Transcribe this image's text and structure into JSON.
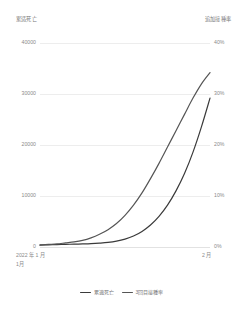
{
  "left_axis_title": "累适死亡",
  "right_axis_title": "追加接種率",
  "x_start_label": "2022 年 1 月",
  "x_start_sublabel": "1月",
  "x_end_label": "2 月",
  "legend": [
    {
      "label": "累適死亡",
      "color": "#3a3a3a",
      "name": "legend-item-deaths"
    },
    {
      "label": "3回目接種率",
      "color": "#555555",
      "name": "legend-item-booster-rate"
    }
  ],
  "chart_data": {
    "type": "line",
    "title": "",
    "xlabel": "",
    "ylabel": "累適死亡",
    "y2label": "追加接種率",
    "grid": true,
    "legend_position": "bottom",
    "x_tick_labels": [
      "2022 年 1 月",
      "2 月"
    ],
    "left_axis": {
      "ticks": [
        0,
        10000,
        20000,
        30000,
        40000
      ],
      "tick_labels": [
        "0",
        "10000",
        "20000",
        "30000",
        "40000"
      ],
      "ylim": [
        0,
        40000
      ]
    },
    "right_axis": {
      "ticks": [
        0,
        10,
        20,
        30,
        40
      ],
      "tick_labels": [
        "0%",
        "10%",
        "20%",
        "30%",
        "40%"
      ],
      "ylim": [
        0,
        40
      ]
    },
    "x": [
      0,
      5,
      10,
      15,
      20,
      25,
      30,
      35,
      40,
      45,
      50,
      55,
      60,
      65,
      70,
      75,
      80,
      85,
      90,
      95,
      100
    ],
    "series": [
      {
        "name": "累適死亡",
        "axis": "left",
        "color": "#3a3a3a",
        "values": [
          350,
          420,
          480,
          520,
          560,
          600,
          660,
          760,
          900,
          1150,
          1550,
          2150,
          3050,
          4300,
          6000,
          8200,
          11000,
          14400,
          18600,
          23600,
          29200
        ]
      },
      {
        "name": "3回目接種率",
        "axis": "right",
        "color": "#555555",
        "values": [
          0.4,
          0.5,
          0.6,
          0.8,
          1.0,
          1.3,
          1.8,
          2.5,
          3.4,
          4.6,
          6.2,
          8.2,
          10.6,
          13.4,
          16.4,
          19.6,
          22.8,
          26.0,
          29.2,
          32.0,
          34.2
        ]
      }
    ]
  }
}
